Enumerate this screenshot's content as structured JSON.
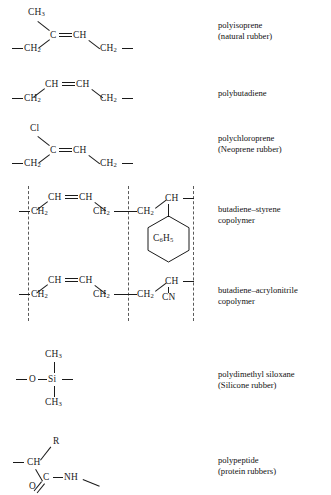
{
  "figure": {
    "type": "chemical-structure-table",
    "background": "#ffffff",
    "ink": "#1a1a1a",
    "divider_color": "#5a5a5a"
  },
  "rows": [
    {
      "id": "polyisoprene",
      "label_lines": [
        "polyisoprene",
        "(natural rubber)"
      ],
      "atoms": [
        "CH3",
        "C",
        "CH",
        "CH2",
        "CH2"
      ],
      "bonds": [
        "C-CH3",
        "C=CH",
        "C-CH2",
        "CH-CH2",
        "open-left",
        "open-right"
      ]
    },
    {
      "id": "polybutadiene",
      "label_lines": [
        "polybutadiene"
      ],
      "atoms": [
        "CH",
        "CH",
        "CH2",
        "CH2"
      ],
      "bonds": [
        "CH=CH",
        "CH-CH2",
        "CH-CH2",
        "open-left",
        "open-right"
      ]
    },
    {
      "id": "polychloroprene",
      "label_lines": [
        "polychloroprene",
        "(Neoprene rubber)"
      ],
      "atoms": [
        "Cl",
        "C",
        "CH",
        "CH2",
        "CH2"
      ],
      "bonds": [
        "C-Cl",
        "C=CH",
        "C-CH2",
        "CH-CH2",
        "open-left",
        "open-right"
      ]
    },
    {
      "id": "butadiene-styrene",
      "label_lines": [
        "butadiene–styrene",
        "copolymer"
      ],
      "atoms": [
        "CH",
        "CH",
        "CH2",
        "CH2",
        "CH2",
        "CH",
        "C6H5"
      ],
      "ring": "C6H5",
      "bonds": [
        "CH=CH",
        "CH-CH2",
        "CH-CH2",
        "CH2-CH2",
        "CH2-CH",
        "CH-ring",
        "open-left",
        "open-right"
      ],
      "dividers": 3
    },
    {
      "id": "butadiene-acrylonitrile",
      "label_lines": [
        "butadiene–acrylonitrile",
        "copolymer"
      ],
      "atoms": [
        "CH",
        "CH",
        "CH2",
        "CH2",
        "CH2",
        "CH",
        "CN"
      ],
      "bonds": [
        "CH=CH",
        "CH-CH2",
        "CH-CH2",
        "CH2-CH2",
        "CH2-CH",
        "CH-CN",
        "open-left",
        "open-right"
      ],
      "dividers": 3
    },
    {
      "id": "polydimethyl-siloxane",
      "label_lines": [
        "polydimethyl siloxane",
        "(Silicone rubber)"
      ],
      "atoms": [
        "CH3",
        "O",
        "Si",
        "CH3"
      ],
      "bonds": [
        "O-Si",
        "Si-CH3-up",
        "Si-CH3-down",
        "open-left",
        "open-right"
      ]
    },
    {
      "id": "polypeptide",
      "label_lines": [
        "polypeptide",
        "(protein rubbers)"
      ],
      "atoms": [
        "R",
        "CH",
        "C",
        "O",
        "NH"
      ],
      "bonds": [
        "CH-R",
        "CH-C",
        "C=O",
        "C-NH",
        "open-left",
        "open-right"
      ]
    }
  ],
  "atom_text": {
    "ch3": "CH",
    "ch3_sub": "3",
    "ch2": "CH",
    "ch2_sub": "2",
    "c": "C",
    "ch": "CH",
    "cl": "Cl",
    "o": "O",
    "si": "Si",
    "nh": "NH",
    "cn": "CN",
    "r": "R",
    "phenyl_c": "C",
    "phenyl_c_sub": "6",
    "phenyl_h": "H",
    "phenyl_h_sub": "5"
  },
  "labels": {
    "l1a": "polyisoprene",
    "l1b": "(natural rubber)",
    "l2a": "polybutadiene",
    "l3a": "polychloroprene",
    "l3b": "(Neoprene rubber)",
    "l4a": "butadiene–styrene",
    "l4b": "copolymer",
    "l5a": "butadiene–acrylonitrile",
    "l5b": "copolymer",
    "l6a": "polydimethyl siloxane",
    "l6b": "(Silicone rubber)",
    "l7a": "polypeptide",
    "l7b": "(protein rubbers)"
  }
}
